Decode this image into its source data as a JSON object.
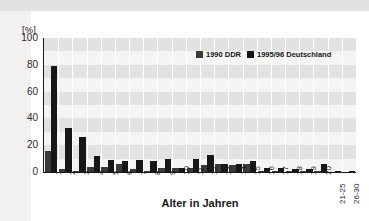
{
  "chart_data": {
    "type": "bar",
    "title": "",
    "xlabel": "Alter in Jahren",
    "ylabel": "[%]",
    "ylim": [
      0,
      100
    ],
    "yticks": [
      100,
      80,
      60,
      40,
      20,
      0
    ],
    "grid": "horizontal-bands-and-vertical-lines",
    "legend_position": "top-right-inside",
    "categories": [
      "1",
      "2",
      "3",
      "4",
      "5",
      "6",
      "7",
      "8",
      "9",
      "10",
      "11",
      "12",
      "13",
      "14",
      "15",
      "16",
      "17",
      "18",
      "19",
      "20",
      "21-25",
      "26-30"
    ],
    "series": [
      {
        "name": "1990 DDR",
        "color": "#3a3a3a",
        "values": [
          16,
          2,
          1,
          4,
          4,
          6,
          2,
          1,
          3,
          3,
          3,
          5,
          6,
          5,
          6,
          1,
          1,
          1,
          1,
          1,
          0,
          0
        ]
      },
      {
        "name": "1995/96 Deutschland",
        "color": "#171717",
        "values": [
          79,
          33,
          26,
          12,
          9,
          8,
          9,
          8,
          10,
          3,
          10,
          13,
          6,
          6,
          8,
          3,
          3,
          2,
          2,
          6,
          1,
          1
        ]
      }
    ]
  },
  "axes": {
    "y_unit_label": "[%]",
    "y_ticks": [
      "100",
      "80",
      "60",
      "40",
      "20",
      "0"
    ],
    "x_title": "Alter in Jahren",
    "x_ticks": [
      "1",
      "2",
      "3",
      "4",
      "5",
      "6",
      "7",
      "8",
      "9",
      "10",
      "11",
      "12",
      "13",
      "14",
      "15",
      "16",
      "17",
      "18",
      "19",
      "20",
      "21-25",
      "26-30"
    ]
  },
  "legend": {
    "items": [
      {
        "label": "1990 DDR",
        "color": "#3a3a3a"
      },
      {
        "label": "1995/96 Deutschland",
        "color": "#171717"
      }
    ]
  },
  "colors": {
    "series1": "#3a3a3a",
    "series2": "#171717",
    "plot_background": "#f4f4f2",
    "band": "#e2e2e0",
    "gridline": "#ffffff",
    "axis": "#1a1a1a",
    "text": "#1a1a1a"
  }
}
